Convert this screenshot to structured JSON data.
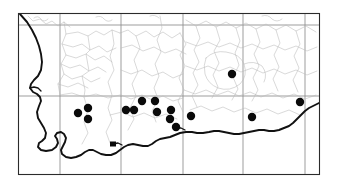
{
  "figure": {
    "type": "distribution-map",
    "region": "Southern Cape, South Africa",
    "background_color": "#ffffff",
    "frame": {
      "x": 18,
      "y": 13,
      "width": 302,
      "height": 162,
      "color": "#2b2b2b"
    },
    "marker": {
      "symbol_name": "filled-circle",
      "color": "#0a0a0a",
      "radius": 4.2,
      "count": 16
    }
  },
  "graticule": {
    "color": "#8d8d8d",
    "meridians": [
      60,
      121,
      183,
      243,
      305
    ],
    "parallels": [
      25,
      96
    ]
  },
  "chart_data": {
    "type": "scatter",
    "title": "",
    "xlabel": "",
    "ylabel": "",
    "xlim": [
      18,
      320
    ],
    "ylim": [
      13,
      175
    ],
    "grid": true,
    "legend": "none",
    "series": [
      {
        "name": "occurrence-records",
        "marker": "filled-circle",
        "color": "#0a0a0a",
        "points": [
          {
            "x": 78,
            "y": 113
          },
          {
            "x": 88,
            "y": 108
          },
          {
            "x": 88,
            "y": 119
          },
          {
            "x": 126,
            "y": 110
          },
          {
            "x": 134,
            "y": 110
          },
          {
            "x": 142,
            "y": 101
          },
          {
            "x": 155,
            "y": 101
          },
          {
            "x": 157,
            "y": 112
          },
          {
            "x": 171,
            "y": 110
          },
          {
            "x": 170,
            "y": 119
          },
          {
            "x": 176,
            "y": 127
          },
          {
            "x": 191,
            "y": 116
          },
          {
            "x": 232,
            "y": 74
          },
          {
            "x": 252,
            "y": 117
          },
          {
            "x": 300,
            "y": 102
          },
          {
            "x": 113,
            "y": 144
          }
        ]
      }
    ]
  }
}
